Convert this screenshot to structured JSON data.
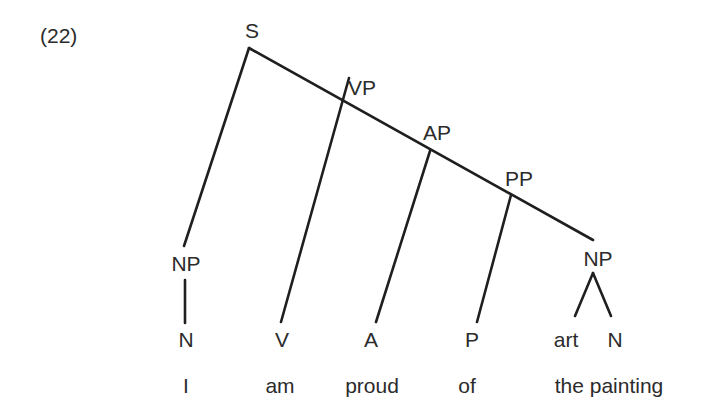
{
  "example_number": "(22)",
  "nodes": {
    "S": "S",
    "VP": "VP",
    "AP": "AP",
    "PP": "PP",
    "NP_subject": "NP",
    "NP_object": "NP",
    "N_subject": "N",
    "V": "V",
    "A": "A",
    "P": "P",
    "art": "art",
    "N_object": "N"
  },
  "words": {
    "w1": "I",
    "w2": "am",
    "w3": "proud",
    "w4": "of",
    "w5": "the painting"
  },
  "colors": {
    "line": "#1f1f1f",
    "text": "#2b2b2b",
    "background": "#ffffff"
  }
}
